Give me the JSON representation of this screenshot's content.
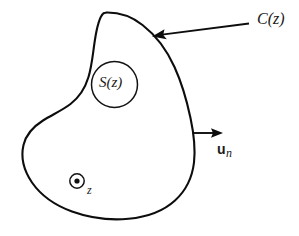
{
  "figure": {
    "background_color": "#ffffff",
    "stroke_color": "#0d0d0d",
    "width": 299,
    "height": 236
  },
  "labels": {
    "contour": "C(z)",
    "surface": "S(z)",
    "normal_symbol": "u",
    "normal_subscript": "n",
    "axis": "z"
  },
  "shapes": {
    "outer_contour": {
      "name": "closed-irregular-contour",
      "path": "M 105.5 12.5 C 126 13.5 150 24 166 43 C 181 61 190 92 193.5 123 C 197 152 193 180 179 198 C 163 218 133 220 106 218.5 C 80 217 55 212 40 197 C 25 182 21 162 22.5 145 C 24 128 34 117 46 109 C 58 101 70 95 78 83 C 86 70 88 50 93 33 C 96.5 21 99 13 105.5 12.5 Z"
    },
    "inner_circle": {
      "name": "surface-circle",
      "cx": 114.5,
      "cy": 84.5,
      "r": 23
    },
    "axis_marker": {
      "name": "out-of-page-axis-marker",
      "cx": 77,
      "cy": 181,
      "r": 7.2,
      "dot_r": 2.6
    },
    "normal_arrow": {
      "name": "outward-normal-arrow",
      "x1": 193,
      "y1": 133,
      "x2": 222,
      "y2": 133
    },
    "contour_leader": {
      "name": "contour-leader-arrow",
      "x1": 249,
      "y1": 23.5,
      "x2": 153,
      "y2": 36
    }
  }
}
